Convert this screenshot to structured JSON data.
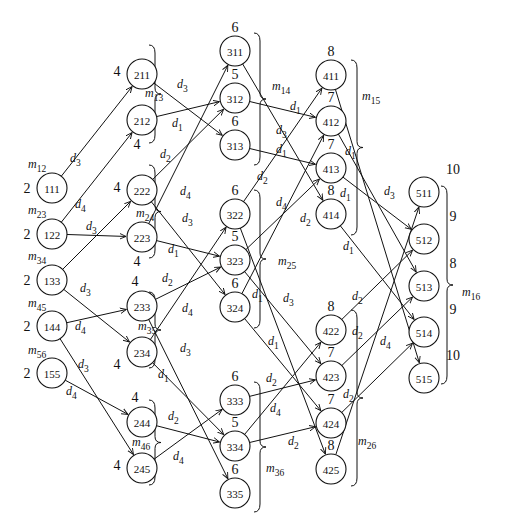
{
  "diagram": {
    "type": "layered-directed-graph",
    "nodes": [
      {
        "id": "111",
        "weight": "2",
        "x": 52,
        "y": 188
      },
      {
        "id": "122",
        "weight": "2",
        "x": 52,
        "y": 234
      },
      {
        "id": "133",
        "weight": "2",
        "x": 52,
        "y": 280
      },
      {
        "id": "144",
        "weight": "2",
        "x": 52,
        "y": 326
      },
      {
        "id": "155",
        "weight": "2",
        "x": 52,
        "y": 373
      },
      {
        "id": "211",
        "weight": "4",
        "x": 142,
        "y": 74
      },
      {
        "id": "212",
        "weight": "4",
        "x": 142,
        "y": 120
      },
      {
        "id": "222",
        "weight": "4",
        "x": 142,
        "y": 190
      },
      {
        "id": "223",
        "weight": "4",
        "x": 142,
        "y": 237
      },
      {
        "id": "233",
        "weight": "4",
        "x": 142,
        "y": 306
      },
      {
        "id": "234",
        "weight": "4",
        "x": 142,
        "y": 352
      },
      {
        "id": "244",
        "weight": "4",
        "x": 142,
        "y": 422
      },
      {
        "id": "245",
        "weight": "4",
        "x": 142,
        "y": 468
      },
      {
        "id": "311",
        "weight": "6",
        "x": 235,
        "y": 51
      },
      {
        "id": "312",
        "weight": "5",
        "x": 235,
        "y": 98
      },
      {
        "id": "313",
        "weight": "6",
        "x": 235,
        "y": 145
      },
      {
        "id": "322",
        "weight": "6",
        "x": 235,
        "y": 214
      },
      {
        "id": "323",
        "weight": "5",
        "x": 235,
        "y": 260
      },
      {
        "id": "324",
        "weight": "6",
        "x": 235,
        "y": 307
      },
      {
        "id": "333",
        "weight": "6",
        "x": 235,
        "y": 400
      },
      {
        "id": "334",
        "weight": "5",
        "x": 235,
        "y": 446
      },
      {
        "id": "335",
        "weight": "6",
        "x": 235,
        "y": 493
      },
      {
        "id": "411",
        "weight": "8",
        "x": 331,
        "y": 75
      },
      {
        "id": "412",
        "weight": "7",
        "x": 331,
        "y": 121
      },
      {
        "id": "413",
        "weight": "7",
        "x": 331,
        "y": 168
      },
      {
        "id": "414",
        "weight": "8",
        "x": 331,
        "y": 214
      },
      {
        "id": "422",
        "weight": "8",
        "x": 331,
        "y": 330
      },
      {
        "id": "423",
        "weight": "7",
        "x": 331,
        "y": 376
      },
      {
        "id": "424",
        "weight": "7",
        "x": 331,
        "y": 423
      },
      {
        "id": "425",
        "weight": "8",
        "x": 331,
        "y": 469
      },
      {
        "id": "511",
        "weight": "10",
        "x": 424,
        "y": 192
      },
      {
        "id": "512",
        "weight": "9",
        "x": 424,
        "y": 239
      },
      {
        "id": "513",
        "weight": "8",
        "x": 424,
        "y": 286
      },
      {
        "id": "514",
        "weight": "9",
        "x": 424,
        "y": 332
      },
      {
        "id": "515",
        "weight": "10",
        "x": 424,
        "y": 378
      }
    ],
    "edges": [
      {
        "from": "111",
        "to": "211",
        "label": "d3",
        "lx": 70,
        "ly": 162
      },
      {
        "from": "122",
        "to": "212",
        "label": "d4",
        "lx": 75,
        "ly": 208
      },
      {
        "from": "122",
        "to": "223",
        "label": "d3",
        "lx": 86,
        "ly": 230
      },
      {
        "from": "133",
        "to": "222",
        "label": "",
        "lx": 0,
        "ly": 0
      },
      {
        "from": "133",
        "to": "234",
        "label": "d3",
        "lx": 80,
        "ly": 292
      },
      {
        "from": "144",
        "to": "233",
        "label": "d4",
        "lx": 75,
        "ly": 330
      },
      {
        "from": "144",
        "to": "245",
        "label": "d3",
        "lx": 78,
        "ly": 368
      },
      {
        "from": "155",
        "to": "244",
        "label": "d4",
        "lx": 66,
        "ly": 395
      },
      {
        "from": "212",
        "to": "312",
        "label": "d1",
        "lx": 172,
        "ly": 127
      },
      {
        "from": "211",
        "to": "313",
        "label": "d3",
        "lx": 177,
        "ly": 88
      },
      {
        "from": "222",
        "to": "312",
        "label": "d2",
        "lx": 160,
        "ly": 158
      },
      {
        "from": "223",
        "to": "311",
        "label": "d4",
        "lx": 180,
        "ly": 195
      },
      {
        "from": "222",
        "to": "324",
        "label": "d3",
        "lx": 182,
        "ly": 222
      },
      {
        "from": "223",
        "to": "323",
        "label": "d1",
        "lx": 168,
        "ly": 253
      },
      {
        "from": "233",
        "to": "323",
        "label": "d2",
        "lx": 162,
        "ly": 282
      },
      {
        "from": "234",
        "to": "322",
        "label": "d4",
        "lx": 182,
        "ly": 312
      },
      {
        "from": "233",
        "to": "335",
        "label": "d3",
        "lx": 180,
        "ly": 352
      },
      {
        "from": "234",
        "to": "334",
        "label": "d1",
        "lx": 158,
        "ly": 378
      },
      {
        "from": "244",
        "to": "334",
        "label": "d2",
        "lx": 168,
        "ly": 420
      },
      {
        "from": "245",
        "to": "333",
        "label": "d4",
        "lx": 173,
        "ly": 460
      },
      {
        "from": "312",
        "to": "412",
        "label": "d1",
        "lx": 290,
        "ly": 110
      },
      {
        "from": "311",
        "to": "414",
        "label": "d3",
        "lx": 276,
        "ly": 134
      },
      {
        "from": "313",
        "to": "413",
        "label": "d1",
        "lx": 276,
        "ly": 153
      },
      {
        "from": "322",
        "to": "411",
        "label": "d2",
        "lx": 257,
        "ly": 180
      },
      {
        "from": "324",
        "to": "412",
        "label": "d4",
        "lx": 276,
        "ly": 206
      },
      {
        "from": "323",
        "to": "413",
        "label": "d2",
        "lx": 300,
        "ly": 222
      },
      {
        "from": "322",
        "to": "425",
        "label": "d3",
        "lx": 283,
        "ly": 302
      },
      {
        "from": "323",
        "to": "423",
        "label": "d1",
        "lx": 252,
        "ly": 298
      },
      {
        "from": "324",
        "to": "424",
        "label": "d1",
        "lx": 268,
        "ly": 345
      },
      {
        "from": "333",
        "to": "423",
        "label": "d2",
        "lx": 266,
        "ly": 382
      },
      {
        "from": "334",
        "to": "422",
        "label": "d4",
        "lx": 270,
        "ly": 412
      },
      {
        "from": "334",
        "to": "424",
        "label": "d2",
        "lx": 288,
        "ly": 445
      },
      {
        "from": "412",
        "to": "513",
        "label": "d1",
        "lx": 345,
        "ly": 155
      },
      {
        "from": "411",
        "to": "515",
        "label": "d3",
        "lx": 384,
        "ly": 195
      },
      {
        "from": "413",
        "to": "512",
        "label": "d1",
        "lx": 340,
        "ly": 197
      },
      {
        "from": "414",
        "to": "514",
        "label": "d1",
        "lx": 343,
        "ly": 250
      },
      {
        "from": "422",
        "to": "512",
        "label": "d2",
        "lx": 352,
        "ly": 300
      },
      {
        "from": "423",
        "to": "513",
        "label": "d2",
        "lx": 352,
        "ly": 335
      },
      {
        "from": "425",
        "to": "511",
        "label": "d4",
        "lx": 380,
        "ly": 345
      },
      {
        "from": "424",
        "to": "514",
        "label": "d2",
        "lx": 343,
        "ly": 398
      }
    ],
    "braces": [
      {
        "label": "m13",
        "x": 155,
        "y1": 45,
        "y2": 143,
        "dir": "right",
        "lx": 145,
        "ly": 97
      },
      {
        "label": "m24",
        "x": 155,
        "y1": 165,
        "y2": 258,
        "dir": "right",
        "lx": 136,
        "ly": 217
      },
      {
        "label": "m35",
        "x": 155,
        "y1": 292,
        "y2": 368,
        "dir": "right",
        "lx": 138,
        "ly": 330
      },
      {
        "label": "m46",
        "x": 155,
        "y1": 400,
        "y2": 485,
        "dir": "right",
        "lx": 132,
        "ly": 446
      },
      {
        "label": "m14",
        "x": 260,
        "y1": 33,
        "y2": 165,
        "dir": "right",
        "lx": 272,
        "ly": 90
      },
      {
        "label": "m25",
        "x": 260,
        "y1": 190,
        "y2": 328,
        "dir": "right",
        "lx": 278,
        "ly": 265
      },
      {
        "label": "m36",
        "x": 260,
        "y1": 382,
        "y2": 512,
        "dir": "right",
        "lx": 266,
        "ly": 472
      },
      {
        "label": "m15",
        "x": 357,
        "y1": 60,
        "y2": 235,
        "dir": "right",
        "lx": 362,
        "ly": 100
      },
      {
        "label": "m26",
        "x": 357,
        "y1": 310,
        "y2": 486,
        "dir": "right",
        "lx": 358,
        "ly": 445
      },
      {
        "label": "m16",
        "x": 447,
        "y1": 186,
        "y2": 384,
        "dir": "right",
        "lx": 462,
        "ly": 296
      }
    ],
    "left_labels": [
      {
        "label": "m12",
        "x": 28,
        "y": 168
      },
      {
        "label": "m23",
        "x": 28,
        "y": 214
      },
      {
        "label": "m34",
        "x": 28,
        "y": 260
      },
      {
        "label": "m45",
        "x": 28,
        "y": 307
      },
      {
        "label": "m56",
        "x": 28,
        "y": 354
      }
    ]
  }
}
